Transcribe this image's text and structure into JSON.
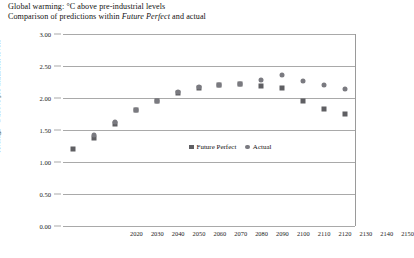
{
  "header": {
    "title_line1": "Global warming: °C above pre-industrial levels",
    "title_line2_pre": "Comparison of predictions within ",
    "title_line2_italic": "Future Perfect",
    "title_line2_post": " and actual"
  },
  "legend": {
    "position": "inside-center-right",
    "items": [
      {
        "label": "Future Perfect",
        "marker": "square",
        "color": "#5f5f63"
      },
      {
        "label": "Actual",
        "marker": "circle",
        "color": "#7a7a80"
      }
    ]
  },
  "chart_data": {
    "type": "scatter",
    "title": "Global warming: °C above pre-industrial levels",
    "subtitle": "Comparison of predictions within Future Perfect and actual",
    "xlabel": "",
    "ylabel": "Average °C above pre-industrial levels",
    "x": [
      2020,
      2030,
      2040,
      2050,
      2060,
      2070,
      2080,
      2090,
      2100,
      2110,
      2120,
      2130,
      2140,
      2150
    ],
    "categories": [
      "2020",
      "2030",
      "2040",
      "2050",
      "2060",
      "2070",
      "2080",
      "2090",
      "2100",
      "2110",
      "2120",
      "2130",
      "2140",
      "2150"
    ],
    "xlim": [
      2015,
      2155
    ],
    "ylim": [
      0.0,
      3.0
    ],
    "ytick_labels": [
      "0.00",
      "0.50",
      "1.00",
      "1.50",
      "2.00",
      "2.50",
      "3.00"
    ],
    "ytick_values": [
      0.0,
      0.5,
      1.0,
      1.5,
      2.0,
      2.5,
      3.0
    ],
    "grid": true,
    "series": [
      {
        "name": "Future Perfect",
        "marker": "square",
        "color": "#5f5f63",
        "values": [
          1.2,
          1.38,
          1.59,
          1.81,
          1.95,
          2.08,
          2.16,
          2.21,
          2.22,
          2.18,
          2.15,
          1.95,
          1.83,
          1.75
        ]
      },
      {
        "name": "Actual",
        "marker": "circle",
        "color": "#7a7a80",
        "values": [
          null,
          1.42,
          1.62,
          1.82,
          1.95,
          2.09,
          2.17,
          2.21,
          2.22,
          2.28,
          2.36,
          2.26,
          2.2,
          2.14
        ]
      }
    ]
  }
}
